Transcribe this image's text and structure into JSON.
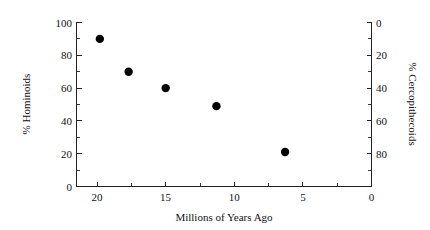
{
  "chart_data": {
    "type": "scatter",
    "title": "",
    "xlabel": "Millions of Years Ago",
    "ylabel": "% Hominoids",
    "y2label": "% Cercopithecoids",
    "xlim": [
      21.5,
      0
    ],
    "ylim": [
      0,
      100
    ],
    "y2lim": [
      100,
      0
    ],
    "x_reversed": true,
    "grid": false,
    "legend": null,
    "x_ticks": [
      "20",
      "15",
      "10",
      "5",
      "0"
    ],
    "x_tick_values": [
      20,
      15,
      10,
      5,
      0
    ],
    "x_minor_step": 2.5,
    "y_ticks": [
      "0",
      "20",
      "40",
      "60",
      "80",
      "100"
    ],
    "y_tick_values": [
      0,
      20,
      40,
      60,
      80,
      100
    ],
    "y_minor_step": 10,
    "y2_ticks": [
      "0",
      "20",
      "40",
      "60",
      "80"
    ],
    "y2_tick_values": [
      0,
      20,
      40,
      60,
      80
    ],
    "y2_minor_step": 10,
    "series": [
      {
        "name": "Hominoid percentage through time",
        "marker": "filled-circle",
        "marker_color": "#000000",
        "marker_size_px": 5.2,
        "points": [
          {
            "x": 19.8,
            "y": 90,
            "y2": 10
          },
          {
            "x": 17.7,
            "y": 70,
            "y2": 30
          },
          {
            "x": 15.0,
            "y": 60,
            "y2": 40
          },
          {
            "x": 11.3,
            "y": 49,
            "y2": 51
          },
          {
            "x": 6.3,
            "y": 21,
            "y2": 79
          }
        ]
      }
    ]
  },
  "figure": {
    "background": "#ffffff",
    "axis_color": "#222222",
    "text_color": "#111111"
  }
}
